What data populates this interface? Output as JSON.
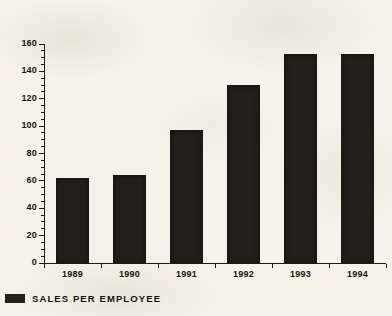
{
  "chart_data": {
    "type": "bar",
    "title": "",
    "xlabel": "",
    "ylabel": "",
    "categories": [
      "1989",
      "1990",
      "1991",
      "1992",
      "1993",
      "1994"
    ],
    "values": [
      62,
      64,
      97,
      130,
      153,
      153
    ],
    "series": [
      {
        "name": "SALES PER EMPLOYEE",
        "values": [
          62,
          64,
          97,
          130,
          153,
          153
        ],
        "color": "#231f1a"
      }
    ],
    "ylim": [
      0,
      160
    ],
    "y_major_ticks": [
      0,
      20,
      40,
      60,
      80,
      100,
      120,
      140,
      160
    ],
    "y_tick_labels": [
      "0",
      "20",
      "40",
      "60",
      "80",
      "100",
      "120",
      "140",
      "160"
    ],
    "y_minor_tick_step": 5,
    "grid": false,
    "legend": {
      "position": "bottom-left",
      "entries": [
        {
          "label": "SALES PER EMPLOYEE",
          "color": "#231f1a",
          "marker": "filled-square"
        }
      ]
    }
  },
  "colors": {
    "background": "#f6f2e9",
    "ink": "#16130f",
    "bar": "#231f1a"
  }
}
